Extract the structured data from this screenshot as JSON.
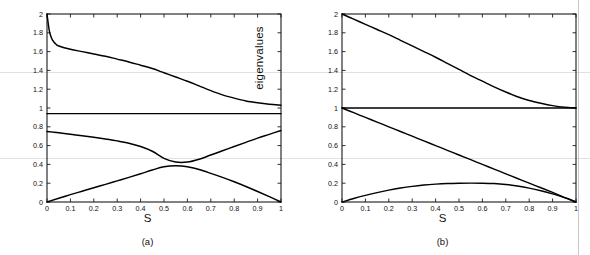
{
  "figure": {
    "title": "",
    "background_color": "#ffffff",
    "line_color": "#000000",
    "axis_color": "#1a1a1a"
  },
  "axes": {
    "xlabel": "S",
    "ylabel": "eigenvalues",
    "xlim": [
      0,
      1
    ],
    "ylim": [
      0,
      2
    ],
    "xticks": [
      "0",
      "0.1",
      "0.2",
      "0.3",
      "0.4",
      "0.5",
      "0.6",
      "0.7",
      "0.8",
      "0.9",
      "1"
    ],
    "xtick_values": [
      0,
      0.1,
      0.2,
      0.3,
      0.4,
      0.5,
      0.6,
      0.7,
      0.8,
      0.9,
      1
    ],
    "yticks": [
      "0",
      "0.2",
      "0.4",
      "0.6",
      "0.8",
      "1",
      "1.2",
      "1.4",
      "1.6",
      "1.8",
      "2"
    ],
    "ytick_values": [
      0,
      0.2,
      0.4,
      0.6,
      0.8,
      1,
      1.2,
      1.4,
      1.6,
      1.8,
      2
    ],
    "grid": false
  },
  "panels": [
    {
      "id": "a",
      "caption": "(a)"
    },
    {
      "id": "b",
      "caption": "(b)"
    }
  ],
  "chart_data": [
    {
      "type": "line",
      "panel": "(a)",
      "title": "",
      "xlabel": "S",
      "ylabel": "eigenvalues",
      "xlim": [
        0,
        1
      ],
      "ylim": [
        0,
        2
      ],
      "grid": false,
      "legend": "none",
      "x": [
        0,
        0.01,
        0.02,
        0.03,
        0.04,
        0.05,
        0.1,
        0.15,
        0.2,
        0.25,
        0.3,
        0.35,
        0.4,
        0.45,
        0.5,
        0.55,
        0.6,
        0.65,
        0.7,
        0.75,
        0.8,
        0.85,
        0.9,
        0.95,
        1
      ],
      "series": [
        {
          "name": "eigenvalue-1",
          "values": [
            2.0,
            1.82,
            1.74,
            1.7,
            1.675,
            1.66,
            1.625,
            1.6,
            1.575,
            1.55,
            1.52,
            1.49,
            1.455,
            1.42,
            1.375,
            1.33,
            1.285,
            1.235,
            1.185,
            1.14,
            1.105,
            1.075,
            1.055,
            1.04,
            1.03
          ]
        },
        {
          "name": "eigenvalue-2",
          "values": [
            0.94,
            0.94,
            0.94,
            0.94,
            0.94,
            0.94,
            0.94,
            0.94,
            0.94,
            0.94,
            0.94,
            0.94,
            0.94,
            0.94,
            0.94,
            0.94,
            0.94,
            0.94,
            0.94,
            0.94,
            0.94,
            0.94,
            0.94,
            0.94,
            0.94
          ]
        },
        {
          "name": "eigenvalue-3",
          "values": [
            0.75,
            0.748,
            0.745,
            0.742,
            0.739,
            0.736,
            0.72,
            0.705,
            0.688,
            0.67,
            0.65,
            0.625,
            0.59,
            0.54,
            0.465,
            0.425,
            0.425,
            0.455,
            0.5,
            0.545,
            0.59,
            0.635,
            0.68,
            0.72,
            0.76
          ]
        },
        {
          "name": "eigenvalue-4",
          "values": [
            0.0,
            0.008,
            0.016,
            0.024,
            0.032,
            0.04,
            0.078,
            0.115,
            0.152,
            0.188,
            0.225,
            0.262,
            0.3,
            0.34,
            0.375,
            0.385,
            0.375,
            0.345,
            0.305,
            0.262,
            0.215,
            0.165,
            0.112,
            0.057,
            0.0
          ]
        }
      ]
    },
    {
      "type": "line",
      "panel": "(b)",
      "title": "",
      "xlabel": "S",
      "ylabel": "eigenvalues",
      "xlim": [
        0,
        1
      ],
      "ylim": [
        0,
        2
      ],
      "grid": false,
      "legend": "none",
      "x": [
        0,
        0.05,
        0.1,
        0.15,
        0.2,
        0.25,
        0.3,
        0.35,
        0.4,
        0.45,
        0.5,
        0.55,
        0.6,
        0.65,
        0.7,
        0.75,
        0.8,
        0.85,
        0.9,
        0.95,
        1
      ],
      "series": [
        {
          "name": "eigenvalue-1",
          "values": [
            2.0,
            1.945,
            1.89,
            1.835,
            1.78,
            1.72,
            1.66,
            1.6,
            1.54,
            1.475,
            1.41,
            1.345,
            1.285,
            1.225,
            1.17,
            1.12,
            1.08,
            1.05,
            1.025,
            1.008,
            1.0
          ]
        },
        {
          "name": "eigenvalue-2",
          "values": [
            1.0,
            1.0,
            1.0,
            1.0,
            1.0,
            1.0,
            1.0,
            1.0,
            1.0,
            1.0,
            1.0,
            1.0,
            1.0,
            1.0,
            1.0,
            1.0,
            1.0,
            1.0,
            1.0,
            1.0,
            1.0
          ]
        },
        {
          "name": "eigenvalue-3",
          "values": [
            1.0,
            0.95,
            0.9,
            0.85,
            0.8,
            0.75,
            0.7,
            0.65,
            0.6,
            0.55,
            0.5,
            0.45,
            0.4,
            0.35,
            0.3,
            0.25,
            0.2,
            0.152,
            0.102,
            0.05,
            0.0
          ]
        },
        {
          "name": "eigenvalue-4",
          "values": [
            0.0,
            0.037,
            0.07,
            0.1,
            0.126,
            0.148,
            0.166,
            0.18,
            0.19,
            0.197,
            0.2,
            0.201,
            0.2,
            0.196,
            0.186,
            0.17,
            0.148,
            0.12,
            0.086,
            0.046,
            0.0
          ]
        }
      ]
    }
  ]
}
